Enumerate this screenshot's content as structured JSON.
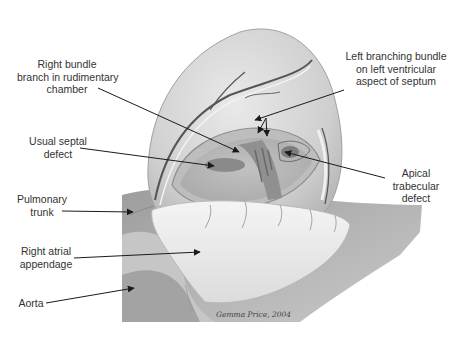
{
  "diagram": {
    "labels": {
      "right_bundle": "Right bundle\nbranch in rudimentary\nchamber",
      "left_bundle": "Left branching bundle\non left ventricular\naspect of septum",
      "usual_septal": "Usual septal\ndefect",
      "apical_trabecular": "Apical\ntrabecular\ndefect",
      "pulmonary_trunk": "Pulmonary\ntrunk",
      "right_atrial_appendage": "Right atrial\nappendage",
      "aorta": "Aorta"
    },
    "signature": "Gemma Price, 2004",
    "colors": {
      "background": "#ffffff",
      "text": "#333333",
      "leader_line": "#1a1a1a",
      "tissue_light": "#e6e6e6",
      "tissue_mid": "#c8c8c8",
      "tissue_dark": "#9a9a9a",
      "defect": "#8a8a8a"
    }
  }
}
